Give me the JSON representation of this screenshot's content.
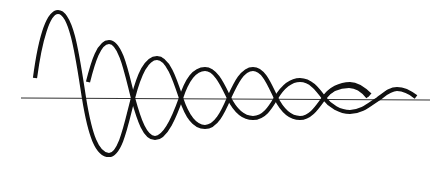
{
  "diagram": {
    "description": "Two phase-shifted damped oscillations crossing a horizontal axis",
    "axis": {
      "x1": 21,
      "y1": 98,
      "x2": 430,
      "y2": 100,
      "color": "#333333"
    },
    "wave_color": "#111111",
    "waves": [
      {
        "name": "wave-a",
        "path": "M35,78 C40,40 48,12 58,12 C72,12 78,60 84,98 C90,135 97,155 109,155 C121,155 127,120 133,98 C139,75 146,58 157,58 C168,58 175,80 181,98 C187,116 194,127 205,127 C216,127 223,112 229,98 C235,85 242,69 253,69 C264,69 270,86 276,98 C282,110 290,118 300,118 C311,118 318,106 324,98 C330,89 340,84 350,84 C358,84 365,90 370,95 M350,112 C362,112 370,104 378,99 C385,94 390,89 397,89 C405,89 411,93 416,97"
      },
      {
        "name": "wave-b",
        "path": "M88,82 C93,62 99,42 109,42 C121,42 127,75 133,98 C139,120 145,138 155,138 C166,138 175,115 181,98 C187,80 194,69 205,69 C216,69 223,86 229,98 C235,110 242,118 253,118 C264,118 270,108 276,98 C282,88 290,80 300,80 C311,80 318,90 324,98 C330,106 340,112 350,112"
      },
      {
        "name": "wave-b-tail",
        "path": "M324,98 C330,90 338,86 349,86 C358,86 364,92 368,97"
      }
    ]
  }
}
